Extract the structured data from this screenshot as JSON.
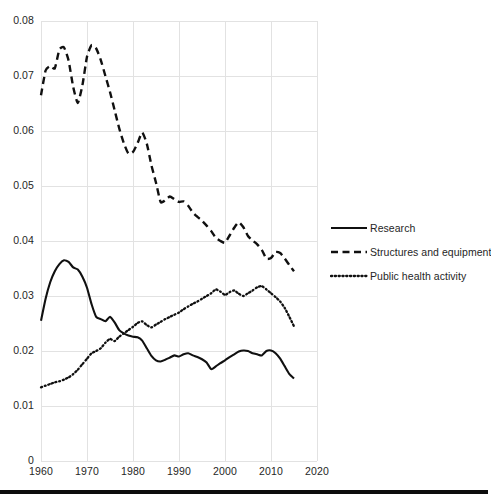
{
  "chart_data": {
    "type": "line",
    "title": "",
    "subtitle": "",
    "xlabel": "",
    "ylabel": "",
    "xlim": [
      1960,
      2020
    ],
    "ylim": [
      0,
      0.08
    ],
    "grid": true,
    "legend_position": "right",
    "x_ticks": [
      "1960",
      "1970",
      "1980",
      "1990",
      "2000",
      "2010",
      "2020"
    ],
    "y_ticks": [
      "0",
      "0.01",
      "0.02",
      "0.03",
      "0.04",
      "0.05",
      "0.06",
      "0.07",
      "0.08"
    ],
    "x": [
      1960,
      1961,
      1962,
      1963,
      1964,
      1965,
      1966,
      1967,
      1968,
      1969,
      1970,
      1971,
      1972,
      1973,
      1974,
      1975,
      1976,
      1977,
      1978,
      1979,
      1980,
      1981,
      1982,
      1983,
      1984,
      1985,
      1986,
      1987,
      1988,
      1989,
      1990,
      1991,
      1992,
      1993,
      1994,
      1995,
      1996,
      1997,
      1998,
      1999,
      2000,
      2001,
      2002,
      2003,
      2004,
      2005,
      2006,
      2007,
      2008,
      2009,
      2010,
      2011,
      2012,
      2013,
      2014,
      2015
    ],
    "series": [
      {
        "name": "Research",
        "style": "solid",
        "color": "#101010",
        "values": [
          0.0255,
          0.0295,
          0.0325,
          0.0345,
          0.0358,
          0.0365,
          0.0362,
          0.0352,
          0.0348,
          0.0335,
          0.0315,
          0.0285,
          0.0262,
          0.0258,
          0.0254,
          0.0262,
          0.0252,
          0.0238,
          0.0232,
          0.0228,
          0.0226,
          0.0225,
          0.0219,
          0.0205,
          0.0191,
          0.0183,
          0.0181,
          0.0184,
          0.0188,
          0.0192,
          0.019,
          0.0194,
          0.0196,
          0.0192,
          0.0189,
          0.0185,
          0.0179,
          0.0167,
          0.0172,
          0.0178,
          0.0183,
          0.0189,
          0.0194,
          0.0199,
          0.0201,
          0.02,
          0.0196,
          0.0194,
          0.0192,
          0.02,
          0.0201,
          0.0196,
          0.0186,
          0.0172,
          0.0158,
          0.015
        ]
      },
      {
        "name": "Structures and equipment",
        "style": "dashed",
        "color": "#101010",
        "values": [
          0.0665,
          0.071,
          0.0718,
          0.0714,
          0.0748,
          0.0752,
          0.0728,
          0.068,
          0.0651,
          0.0683,
          0.0735,
          0.0756,
          0.075,
          0.0729,
          0.07,
          0.0671,
          0.0638,
          0.0605,
          0.0578,
          0.0559,
          0.0562,
          0.0578,
          0.0597,
          0.0577,
          0.0538,
          0.0506,
          0.0471,
          0.0474,
          0.0481,
          0.0476,
          0.0471,
          0.0472,
          0.0464,
          0.0452,
          0.0444,
          0.0437,
          0.0428,
          0.0418,
          0.0406,
          0.04,
          0.0397,
          0.041,
          0.0424,
          0.0434,
          0.0425,
          0.0409,
          0.0401,
          0.0394,
          0.0384,
          0.0368,
          0.0369,
          0.038,
          0.0378,
          0.0368,
          0.0356,
          0.0345
        ]
      },
      {
        "name": "Public health activity",
        "style": "dotted",
        "color": "#101010",
        "values": [
          0.0134,
          0.0137,
          0.014,
          0.0143,
          0.0145,
          0.0148,
          0.0152,
          0.0158,
          0.0166,
          0.0176,
          0.0186,
          0.0196,
          0.02,
          0.0205,
          0.0215,
          0.0222,
          0.0218,
          0.0226,
          0.0232,
          0.0238,
          0.0244,
          0.0251,
          0.0254,
          0.0247,
          0.0243,
          0.0248,
          0.0253,
          0.0258,
          0.0262,
          0.0266,
          0.027,
          0.0276,
          0.0281,
          0.0286,
          0.029,
          0.0295,
          0.03,
          0.0305,
          0.0312,
          0.0308,
          0.0302,
          0.0307,
          0.031,
          0.0304,
          0.03,
          0.0305,
          0.031,
          0.0316,
          0.0318,
          0.0312,
          0.0305,
          0.0298,
          0.029,
          0.0278,
          0.0262,
          0.0245
        ]
      }
    ]
  },
  "legend": {
    "items": [
      {
        "label": "Research",
        "style": "solid"
      },
      {
        "label": "Structures and equipment",
        "style": "dashed"
      },
      {
        "label": "Public health activity",
        "style": "dotted"
      }
    ]
  },
  "axes": {
    "y_tick_labels": [
      "0.08",
      "0.07",
      "0.06",
      "0.05",
      "0.04",
      "0.03",
      "0.02",
      "0.01",
      "0"
    ],
    "x_tick_labels": [
      "1960",
      "1970",
      "1980",
      "1990",
      "2000",
      "2010",
      "2020"
    ]
  },
  "colors": {
    "line": "#101010",
    "grid": "#e2e2e2",
    "text": "#262626",
    "rule": "#0d0d0d",
    "background": "#ffffff"
  }
}
